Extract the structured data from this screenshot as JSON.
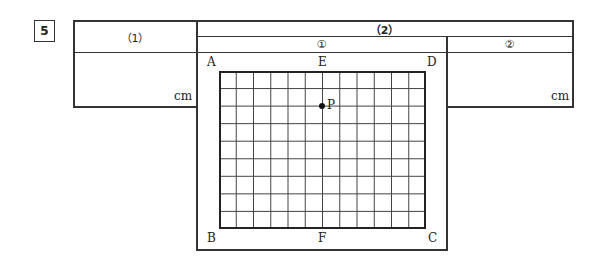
{
  "question": {
    "number": "5"
  },
  "table": {
    "part1": {
      "header": "（1）",
      "unit": "cm"
    },
    "part2": {
      "header": "（2）",
      "sub1": {
        "header": "①",
        "figure": {
          "corner_labels": {
            "top_left": "A",
            "top_mid": "E",
            "top_right": "D",
            "bottom_left": "B",
            "bottom_mid": "F",
            "bottom_right": "C"
          },
          "point_label": "P",
          "grid_columns": 12,
          "grid_rows": 9,
          "point_position": {
            "column": 6,
            "row": 2
          }
        }
      },
      "sub2": {
        "header": "②",
        "unit": "cm"
      }
    }
  }
}
